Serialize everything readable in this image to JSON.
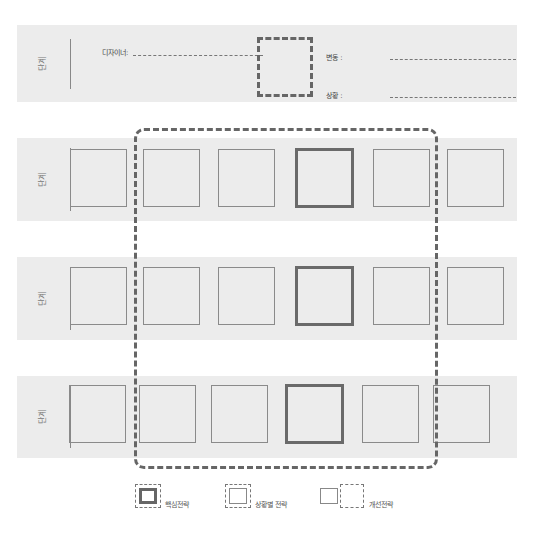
{
  "header": {
    "stage_label": "단계",
    "designer_label": "디자이너:",
    "variation_label": "변동 :",
    "situation_label": "상황 :"
  },
  "rows": [
    {
      "stage_label": "단계",
      "boxes": [
        "normal",
        "normal",
        "normal",
        "core",
        "normal",
        "normal"
      ]
    },
    {
      "stage_label": "단계",
      "boxes": [
        "normal",
        "normal",
        "normal",
        "core",
        "normal",
        "normal"
      ]
    },
    {
      "stage_label": "단계",
      "boxes": [
        "normal",
        "normal",
        "normal",
        "core",
        "normal",
        "normal"
      ]
    }
  ],
  "legend": {
    "core": "핵심전략",
    "situational": "상황별 전략",
    "improvement": "개선전략"
  },
  "colors": {
    "band": "#ececec",
    "dash": "#666666",
    "box_border": "#8a8a8a",
    "core_border": "#6a6a6a"
  }
}
